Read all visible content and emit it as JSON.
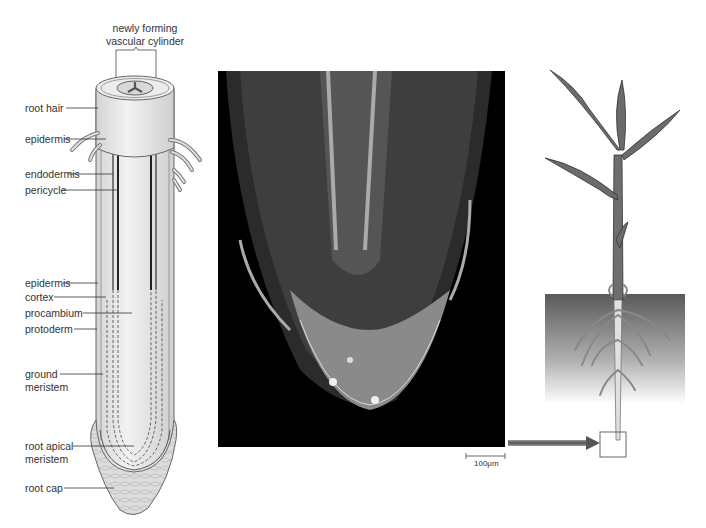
{
  "figure": {
    "title_label": {
      "line1": "newly forming",
      "line2": "vascular cylinder"
    },
    "root_labels": [
      {
        "id": "root-hair",
        "text": "root hair"
      },
      {
        "id": "epidermis-top",
        "text": "epidermis"
      },
      {
        "id": "endodermis",
        "text": "endodermis"
      },
      {
        "id": "pericycle",
        "text": "pericycle"
      },
      {
        "id": "epidermis",
        "text": "epidermis"
      },
      {
        "id": "cortex",
        "text": "cortex"
      },
      {
        "id": "procambium",
        "text": "procambium"
      },
      {
        "id": "protoderm",
        "text": "protoderm"
      },
      {
        "id": "ground-meristem",
        "line1": "ground",
        "line2": "meristem"
      },
      {
        "id": "root-apical-meristem",
        "line1": "root apical",
        "line2": "meristem"
      },
      {
        "id": "root-cap",
        "text": "root cap"
      }
    ],
    "micrograph": {
      "scale_bar": "100μm"
    },
    "colors": {
      "root_fill": "#e6e6e6",
      "root_outline": "#555555",
      "micrograph_bg": "#000000",
      "plant_fill": "#6b6b6b",
      "soil_top": "#5a5a5a",
      "arrow": "#777777"
    }
  }
}
